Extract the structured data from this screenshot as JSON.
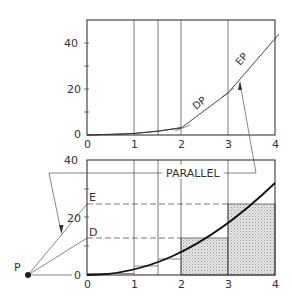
{
  "top_graph": {
    "y_ticks": [
      "0",
      "20",
      "40"
    ],
    "x_ticks": [
      "0",
      "1",
      "2",
      "3",
      "4"
    ],
    "labels": {
      "dp": "DP",
      "ep": "EP"
    }
  },
  "bottom_graph": {
    "y_ticks": [
      "0",
      "20",
      "40"
    ],
    "x_ticks": [
      "0",
      "1",
      "2",
      "3",
      "4"
    ],
    "labels": {
      "e": "E",
      "d": "D",
      "p": "P",
      "parallel": "PARALLEL"
    }
  },
  "colors": {
    "ink": "#222222",
    "hatch": "#c8c8c8",
    "background": "#ffffff"
  }
}
